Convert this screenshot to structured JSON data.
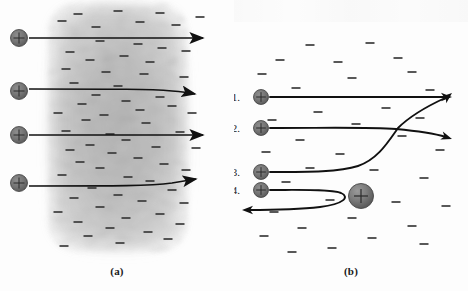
{
  "figure": {
    "type": "physics-diagram",
    "panels": [
      {
        "id": "a",
        "caption": "(a)",
        "model": "Thomson plum-pudding: diffuse positive charge cloud",
        "cloud": {
          "x": 50,
          "y": 4,
          "width": 136,
          "height": 246,
          "color": "#b9b9b9"
        },
        "alpha_particles": [
          {
            "index": 1,
            "cx": 19,
            "cy": 38,
            "r": 8.5
          },
          {
            "index": 2,
            "cx": 19,
            "cy": 91,
            "r": 8.5
          },
          {
            "index": 3,
            "cx": 19,
            "cy": 135,
            "r": 8.5
          },
          {
            "index": 4,
            "cx": 19,
            "cy": 183,
            "r": 8.5
          }
        ],
        "trajectories": [
          {
            "index": 1,
            "path": "M29,38 L203,38",
            "deflection": "none"
          },
          {
            "index": 2,
            "path": "M29,89 C120,89 150,89 172,91 C184,92 190,93 195,94",
            "deflection": "slight-down"
          },
          {
            "index": 3,
            "path": "M29,135 L203,135",
            "deflection": "none"
          },
          {
            "index": 4,
            "path": "M29,186 C120,186 150,186 172,183 C184,181 190,180 196,179",
            "deflection": "slight-up"
          }
        ],
        "electron_signs": [
          [
            78,
            14
          ],
          [
            118,
            11
          ],
          [
            160,
            13
          ],
          [
            200,
            17
          ],
          [
            62,
            21
          ],
          [
            140,
            22
          ],
          [
            176,
            25
          ],
          [
            96,
            27
          ],
          [
            100,
            41
          ],
          [
            138,
            44
          ],
          [
            162,
            48
          ],
          [
            70,
            52
          ],
          [
            186,
            51
          ],
          [
            124,
            56
          ],
          [
            90,
            60
          ],
          [
            150,
            62
          ],
          [
            66,
            69
          ],
          [
            106,
            72
          ],
          [
            144,
            74
          ],
          [
            184,
            77
          ],
          [
            74,
            83
          ],
          [
            118,
            86
          ],
          [
            96,
            95
          ],
          [
            160,
            97
          ],
          [
            126,
            101
          ],
          [
            82,
            104
          ],
          [
            172,
            106
          ],
          [
            140,
            110
          ],
          [
            58,
            113
          ],
          [
            104,
            115
          ],
          [
            192,
            113
          ],
          [
            86,
            120
          ],
          [
            146,
            123
          ],
          [
            66,
            131
          ],
          [
            110,
            134
          ],
          [
            180,
            132
          ],
          [
            126,
            140
          ],
          [
            90,
            145
          ],
          [
            156,
            147
          ],
          [
            70,
            150
          ],
          [
            196,
            148
          ],
          [
            112,
            153
          ],
          [
            138,
            158
          ],
          [
            80,
            162
          ],
          [
            164,
            164
          ],
          [
            100,
            168
          ],
          [
            186,
            170
          ],
          [
            62,
            175
          ],
          [
            128,
            177
          ],
          [
            150,
            181
          ],
          [
            92,
            188
          ],
          [
            172,
            190
          ],
          [
            118,
            195
          ],
          [
            74,
            198
          ],
          [
            142,
            201
          ],
          [
            184,
            203
          ],
          [
            100,
            207
          ],
          [
            58,
            212
          ],
          [
            160,
            214
          ],
          [
            126,
            218
          ],
          [
            78,
            222
          ],
          [
            180,
            224
          ],
          [
            110,
            228
          ],
          [
            148,
            232
          ],
          [
            88,
            236
          ],
          [
            168,
            239
          ],
          [
            120,
            243
          ],
          [
            64,
            246
          ]
        ]
      },
      {
        "id": "b",
        "caption": "(b)",
        "model": "Rutherford nuclear model: concentrated positive nucleus",
        "nucleus": {
          "cx": 361,
          "cy": 196,
          "r": 12.5,
          "label": "+"
        },
        "track_labels": [
          "1.",
          "2.",
          "3.",
          "4."
        ],
        "alpha_particles": [
          {
            "index": 1,
            "cx": 261,
            "cy": 97,
            "r": 7.5,
            "label_x": 240,
            "label_y": 101
          },
          {
            "index": 2,
            "cx": 261,
            "cy": 128,
            "r": 7.5,
            "label_x": 240,
            "label_y": 132
          },
          {
            "index": 3,
            "cx": 261,
            "cy": 172,
            "r": 7.5,
            "label_x": 240,
            "label_y": 176
          },
          {
            "index": 4,
            "cx": 261,
            "cy": 190,
            "r": 7.5,
            "label_x": 240,
            "label_y": 194
          }
        ],
        "trajectories": [
          {
            "index": 1,
            "path": "M270,97 L447,97",
            "deflection": "none",
            "arrow": [
              452,
              97,
              0
            ]
          },
          {
            "index": 2,
            "path": "M270,128 C330,128 370,127 396,129 C418,131 436,134 446,137",
            "deflection": "small-angle",
            "arrow": [
              452,
              139,
              18
            ]
          },
          {
            "index": 3,
            "path": "M270,172 C310,172 340,172 358,166 C378,159 388,142 398,128 C412,114 432,104 445,98",
            "deflection": "large-angle",
            "arrow": [
              452,
              93,
              -40
            ]
          },
          {
            "index": 4,
            "path": "M270,190 C300,190 330,189 341,193 C350,197 344,204 320,207 C295,210 270,210 248,210",
            "deflection": "backscatter-180",
            "arrow": [
              242,
              210,
              180
            ]
          }
        ],
        "electron_signs": [
          [
            310,
            45
          ],
          [
            370,
            43
          ],
          [
            280,
            60
          ],
          [
            338,
            62
          ],
          [
            398,
            58
          ],
          [
            262,
            74
          ],
          [
            352,
            78
          ],
          [
            412,
            72
          ],
          [
            296,
            88
          ],
          [
            430,
            90
          ],
          [
            318,
            112
          ],
          [
            386,
            108
          ],
          [
            272,
            120
          ],
          [
            356,
            124
          ],
          [
            420,
            118
          ],
          [
            300,
            140
          ],
          [
            402,
            136
          ],
          [
            266,
            152
          ],
          [
            340,
            154
          ],
          [
            440,
            150
          ],
          [
            310,
            168
          ],
          [
            374,
            170
          ],
          [
            286,
            182
          ],
          [
            424,
            178
          ],
          [
            330,
            200
          ],
          [
            396,
            202
          ],
          [
            274,
            212
          ],
          [
            446,
            206
          ],
          [
            352,
            218
          ],
          [
            302,
            228
          ],
          [
            412,
            226
          ],
          [
            264,
            236
          ],
          [
            372,
            238
          ],
          [
            332,
            248
          ],
          [
            424,
            244
          ],
          [
            292,
            252
          ]
        ]
      }
    ]
  }
}
